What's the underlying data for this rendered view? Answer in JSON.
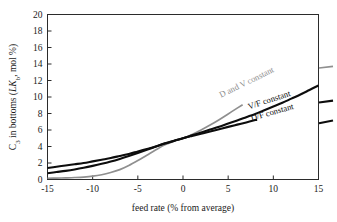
{
  "chart_data": {
    "type": "line",
    "title": "",
    "xlabel": "feed rate (% from average)",
    "ylabel": "C3 in bottoms (LKb, mol %)",
    "ylabel_parts": {
      "lead": "C",
      "sub1": "3",
      "mid": " in bottoms (",
      "italic": "LK",
      "sub2": "b",
      "tail": ",  mol %)"
    },
    "xlim": [
      -15,
      15
    ],
    "ylim": [
      0,
      20
    ],
    "xticks": [
      -15,
      -10,
      -5,
      0,
      5,
      10,
      15
    ],
    "xticklabels": [
      "-15",
      "-10",
      "-5",
      "0",
      "5",
      "10",
      "15"
    ],
    "yticks": [
      0,
      2,
      4,
      6,
      8,
      10,
      12,
      14,
      16,
      18,
      20
    ],
    "yticklabels": [
      "0",
      "2",
      "4",
      "6",
      "8",
      "10",
      "12",
      "14",
      "16",
      "18",
      "20"
    ],
    "grid": false,
    "legend_position": "inline-annotations",
    "series": [
      {
        "name": "D and V constant",
        "color": "#8f8f8f",
        "label_text": "D and V constant",
        "label_rotation": -26,
        "x": [
          -15,
          -14,
          -13,
          -12,
          -11,
          -10,
          -9,
          -8,
          -7,
          -6,
          -5,
          -4,
          -3,
          -2,
          -1,
          0,
          1,
          2,
          3,
          4,
          5,
          6,
          7,
          8,
          9,
          10,
          11,
          12,
          13,
          14,
          15
        ],
        "y": [
          0.15,
          0.17,
          0.2,
          0.24,
          0.3,
          0.4,
          0.58,
          0.85,
          1.2,
          1.7,
          2.3,
          2.95,
          3.6,
          4.2,
          4.65,
          5.0,
          5.45,
          6.0,
          6.6,
          7.25,
          7.95,
          8.65,
          9.35,
          10.0,
          10.65,
          11.25,
          11.8,
          12.3,
          12.75,
          13.15,
          13.5
        ]
      },
      {
        "name": "V/F constant",
        "color": "#0d0d0d",
        "label_text": "V/F constant",
        "label_rotation": -18,
        "x": [
          -15,
          -14,
          -13,
          -12,
          -11,
          -10,
          -9,
          -8,
          -7,
          -6,
          -5,
          -4,
          -3,
          -2,
          -1,
          0,
          1,
          2,
          3,
          4,
          5,
          6,
          7,
          8,
          9,
          10,
          11,
          12,
          13,
          14,
          15
        ],
        "y": [
          1.4,
          1.55,
          1.7,
          1.85,
          2.0,
          2.2,
          2.4,
          2.6,
          2.85,
          3.1,
          3.4,
          3.7,
          4.0,
          4.35,
          4.68,
          5.0,
          5.35,
          5.7,
          6.05,
          6.4,
          6.78,
          7.15,
          7.55,
          7.95,
          8.4,
          8.85,
          9.3,
          9.8,
          10.3,
          10.85,
          11.4
        ]
      },
      {
        "name": "D/F constant",
        "color": "#0d0d0d",
        "label_text": "D/F constant",
        "label_rotation": -16,
        "x": [
          -15,
          -14,
          -13,
          -12,
          -11,
          -10,
          -9,
          -8,
          -7,
          -6,
          -5,
          -4,
          -3,
          -2,
          -1,
          0,
          1,
          2,
          3,
          4,
          5,
          6,
          7,
          8,
          9,
          10,
          11,
          12,
          13,
          14,
          15
        ],
        "y": [
          0.75,
          0.9,
          1.05,
          1.22,
          1.42,
          1.65,
          1.9,
          2.18,
          2.5,
          2.85,
          3.22,
          3.6,
          4.0,
          4.38,
          4.7,
          5.0,
          5.28,
          5.55,
          5.82,
          6.1,
          6.38,
          6.65,
          6.92,
          7.2,
          7.5,
          7.8,
          8.1,
          8.4,
          8.7,
          9.0,
          9.3
        ]
      }
    ],
    "annotations": [
      {
        "text": "D and V constant",
        "color": "#8f8f8f",
        "x_data": 4.2,
        "y_data": 9.9
      },
      {
        "text": "V/F constant",
        "color": "#0d0d0d",
        "x_data": 7.3,
        "y_data": 8.5
      },
      {
        "text": "D/F constant",
        "color": "#0d0d0d",
        "x_data": 7.6,
        "y_data": 7.1
      }
    ]
  }
}
